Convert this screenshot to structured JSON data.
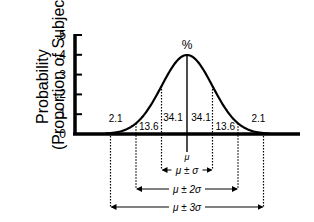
{
  "chart_data": {
    "type": "line",
    "title": "",
    "ylabel_lines": [
      "Probability",
      "(Proportion of Subjects)"
    ],
    "xlabel": "",
    "yticks": [
      ".5",
      ".4",
      ".3",
      ".2",
      ".1",
      "0"
    ],
    "ytick_values": [
      0.5,
      0.4,
      0.3,
      0.2,
      0.1,
      0
    ],
    "ylim": [
      0,
      0.5
    ],
    "grid": false,
    "curve": "normal distribution (bell curve)",
    "peak_value": 0.399,
    "peak_label": "%",
    "mean_label": "μ",
    "region_percentages": [
      {
        "region": "below μ-2σ",
        "label": "2.1"
      },
      {
        "region": "μ-2σ to μ-σ",
        "label": "13.6"
      },
      {
        "region": "μ-σ to μ",
        "label": "34.1"
      },
      {
        "region": "μ to μ+σ",
        "label": "34.1"
      },
      {
        "region": "μ+σ to μ+2σ",
        "label": "13.6"
      },
      {
        "region": "above μ+2σ",
        "label": "2.1"
      }
    ],
    "ranges": [
      {
        "label": "μ ± σ",
        "sigma": 1
      },
      {
        "label": "μ ± 2σ",
        "sigma": 2
      },
      {
        "label": "μ ± 3σ",
        "sigma": 3
      }
    ]
  }
}
